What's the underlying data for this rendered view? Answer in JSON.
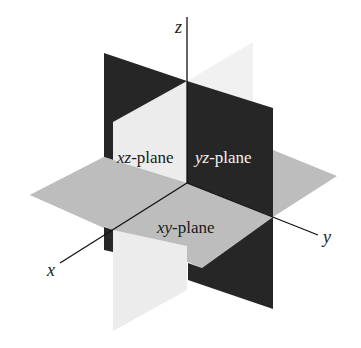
{
  "diagram": {
    "axes": {
      "x": {
        "label": "x"
      },
      "y": {
        "label": "y"
      },
      "z": {
        "label": "z"
      }
    },
    "planes": [
      {
        "id": "xz",
        "var": "xz",
        "suffix": "-plane",
        "color": "#ececec",
        "text_color": "#1a1a1a"
      },
      {
        "id": "yz",
        "var": "yz",
        "suffix": "-plane",
        "color": "#262626",
        "text_color": "#f2f2f2"
      },
      {
        "id": "xy",
        "var": "xy",
        "suffix": "-plane",
        "color": "#bdbdbd",
        "text_color": "#1a1a1a"
      }
    ],
    "colors": {
      "dark": "#262626",
      "light": "#ececec",
      "light_back": "#f1f1f1",
      "gray": "#bdbdbd",
      "axis": "#111111"
    }
  }
}
